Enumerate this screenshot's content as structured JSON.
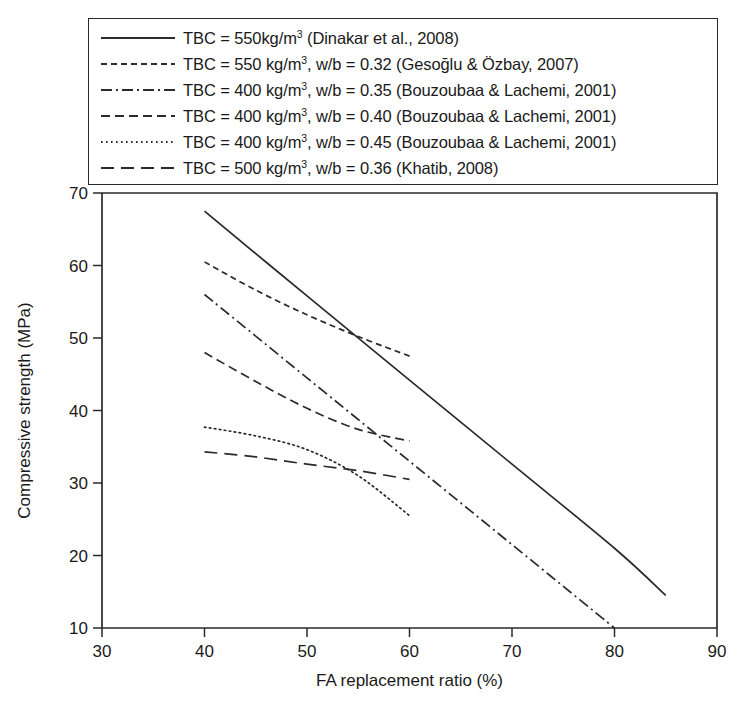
{
  "chart_data": {
    "type": "line",
    "title": "",
    "xlabel": "FA replacement ratio (%)",
    "ylabel": "Compressive strength (MPa)",
    "xlim": [
      30,
      90
    ],
    "ylim": [
      10,
      70
    ],
    "xticks": [
      30,
      40,
      50,
      60,
      70,
      80,
      90
    ],
    "yticks": [
      10,
      20,
      30,
      40,
      50,
      60,
      70
    ],
    "grid": false,
    "legend_position": "above-plot",
    "series": [
      {
        "name": "TBC = 550 kg/m3 (Dinakar et al., 2008)",
        "style": "solid",
        "x": [
          40,
          50,
          60,
          70,
          80,
          85
        ],
        "y": [
          67.5,
          55.8,
          44.2,
          32.6,
          21.0,
          14.5
        ]
      },
      {
        "name": "TBC = 550 kg/m3, w/b = 0.32 (Gesoglu & Ozbay, 2007)",
        "style": "dashed-short",
        "x": [
          40,
          45,
          50,
          55,
          60
        ],
        "y": [
          60.5,
          56.6,
          53.2,
          50.2,
          47.5
        ]
      },
      {
        "name": "TBC = 400 kg/m3, w/b = 0.35 (Bouzoubaa & Lachemi, 2001)",
        "style": "dash-dot",
        "x": [
          40,
          50,
          60,
          70,
          80
        ],
        "y": [
          56.0,
          44.5,
          33.0,
          21.5,
          10.0
        ]
      },
      {
        "name": "TBC = 400 kg/m3, w/b = 0.40 (Bouzoubaa & Lachemi, 2001)",
        "style": "dashed-long",
        "x": [
          40,
          45,
          50,
          55,
          60
        ],
        "y": [
          48.0,
          44.0,
          40.3,
          37.4,
          35.8
        ]
      },
      {
        "name": "TBC = 400 kg/m3, w/b = 0.45 (Bouzoubaa & Lachemi, 2001)",
        "style": "dotted",
        "x": [
          40,
          45,
          50,
          55,
          60
        ],
        "y": [
          37.7,
          36.5,
          34.6,
          31.0,
          25.5
        ]
      },
      {
        "name": "TBC = 500 kg/m3, w/b = 0.36 (Khatib, 2008)",
        "style": "dashed-wide",
        "x": [
          40,
          45,
          50,
          55,
          60
        ],
        "y": [
          34.3,
          33.6,
          32.6,
          31.7,
          30.5
        ]
      }
    ]
  },
  "legend": {
    "entries": [
      {
        "style": "solid",
        "prefix": "TBC = 550",
        "unit": "kg/m",
        "exp": "3",
        "suffix": " (Dinakar et al., 2008)"
      },
      {
        "style": "dashed-short",
        "prefix": "TBC = 550 ",
        "unit": "kg/m",
        "exp": "3",
        "suffix": ", w/b = 0.32 (Gesoğlu & Özbay, 2007)"
      },
      {
        "style": "dash-dot",
        "prefix": "TBC = 400 ",
        "unit": "kg/m",
        "exp": "3",
        "suffix": ", w/b = 0.35 (Bouzoubaa & Lachemi, 2001)"
      },
      {
        "style": "dashed-long",
        "prefix": "TBC = 400 ",
        "unit": "kg/m",
        "exp": "3",
        "suffix": ", w/b = 0.40 (Bouzoubaa & Lachemi, 2001)"
      },
      {
        "style": "dotted",
        "prefix": "TBC = 400 ",
        "unit": "kg/m",
        "exp": "3",
        "suffix": ", w/b = 0.45 (Bouzoubaa & Lachemi, 2001)"
      },
      {
        "style": "dashed-wide",
        "prefix": "TBC = 500 ",
        "unit": "kg/m",
        "exp": "3",
        "suffix": ", w/b = 0.36 (Khatib, 2008)"
      }
    ]
  },
  "axes": {
    "x_label": "FA replacement ratio (%)",
    "y_label": "Compressive strength (MPa)",
    "x_tick_labels": [
      "30",
      "40",
      "50",
      "60",
      "70",
      "80",
      "90"
    ],
    "y_tick_labels": [
      "10",
      "20",
      "30",
      "40",
      "50",
      "60",
      "70"
    ]
  },
  "colors": {
    "ink": "#2a2a2a",
    "background": "#ffffff"
  }
}
